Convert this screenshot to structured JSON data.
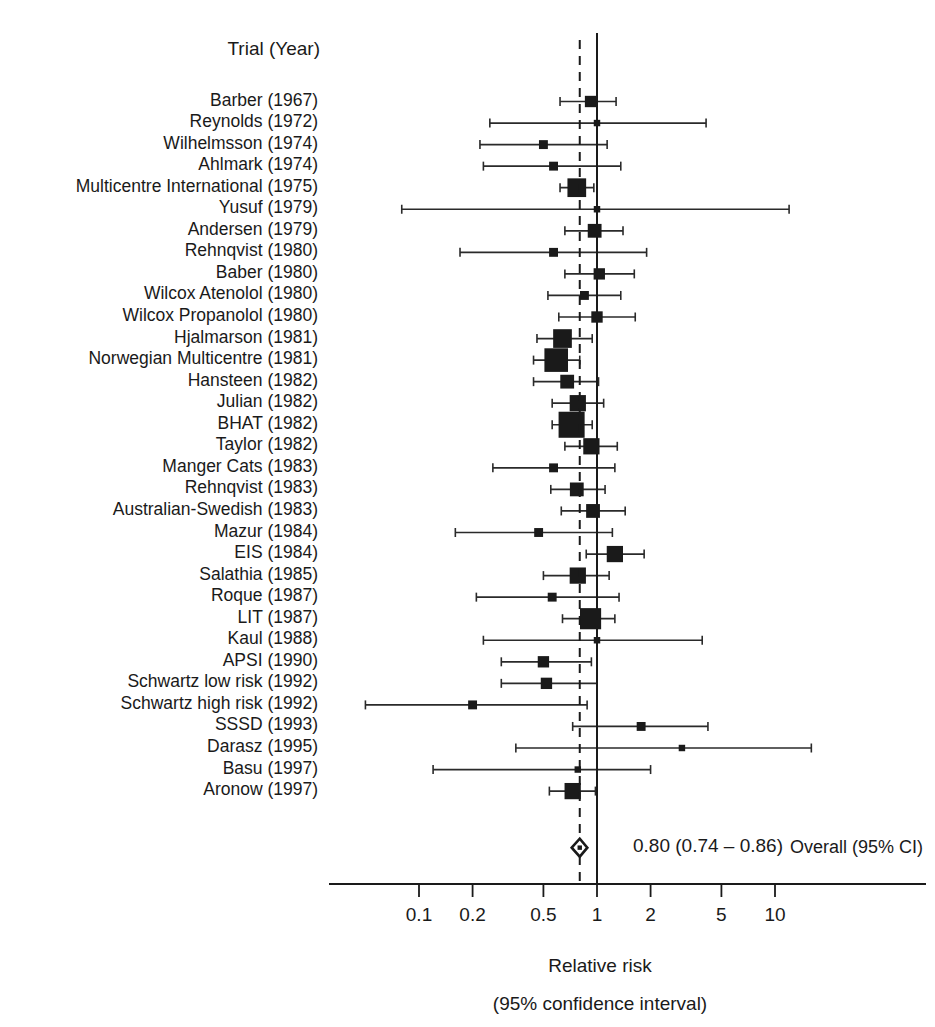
{
  "header": {
    "column_title": "Trial (Year)"
  },
  "axis": {
    "title_line1": "Relative risk",
    "title_line2": "(95% confidence interval)",
    "scale": "log",
    "tick_labels": [
      "0.1",
      "0.2",
      "0.5",
      "1",
      "2",
      "5",
      "10"
    ],
    "tick_values": [
      0.1,
      0.2,
      0.5,
      1,
      2,
      5,
      10
    ],
    "xmin": 0.07,
    "xmax": 16
  },
  "overall": {
    "label": "Overall (95% CI)",
    "value_text": "0.80 (0.74 – 0.86)",
    "rr": 0.8,
    "lower": 0.74,
    "upper": 0.86
  },
  "reference_line": 1,
  "pooled_line": 0.8,
  "chart_data": {
    "type": "forest",
    "title": "Trial (Year)",
    "xlabel": "Relative risk (95% confidence interval)",
    "xscale": "log",
    "xlim": [
      0.07,
      16
    ],
    "xticks": [
      0.1,
      0.2,
      0.5,
      1,
      2,
      5,
      10
    ],
    "effect_measure": "Relative risk",
    "null_value": 1,
    "pooled": {
      "label": "Overall (95% CI)",
      "rr": 0.8,
      "lower": 0.74,
      "upper": 0.86,
      "text": "0.80 (0.74 – 0.86)"
    },
    "studies": [
      {
        "label": "Barber (1967)",
        "rr": 0.92,
        "lower": 0.62,
        "upper": 1.28,
        "weight": 3
      },
      {
        "label": "Reynolds (1972)",
        "rr": 1.0,
        "lower": 0.25,
        "upper": 4.1,
        "weight": 1
      },
      {
        "label": "Wilhelmsson (1974)",
        "rr": 0.5,
        "lower": 0.22,
        "upper": 1.14,
        "weight": 2
      },
      {
        "label": "Ahlmark (1974)",
        "rr": 0.57,
        "lower": 0.23,
        "upper": 1.36,
        "weight": 2
      },
      {
        "label": "Multicentre International (1975)",
        "rr": 0.77,
        "lower": 0.62,
        "upper": 0.96,
        "weight": 6
      },
      {
        "label": "Yusuf (1979)",
        "rr": 1.0,
        "lower": 0.08,
        "upper": 12.0,
        "weight": 1
      },
      {
        "label": "Andersen (1979)",
        "rr": 0.97,
        "lower": 0.66,
        "upper": 1.4,
        "weight": 4
      },
      {
        "label": "Rehnqvist (1980)",
        "rr": 0.57,
        "lower": 0.17,
        "upper": 1.9,
        "weight": 2
      },
      {
        "label": "Baber (1980)",
        "rr": 1.03,
        "lower": 0.66,
        "upper": 1.62,
        "weight": 3
      },
      {
        "label": "Wilcox Atenolol (1980)",
        "rr": 0.85,
        "lower": 0.53,
        "upper": 1.36,
        "weight": 2
      },
      {
        "label": "Wilcox Propanolol (1980)",
        "rr": 1.0,
        "lower": 0.61,
        "upper": 1.64,
        "weight": 3
      },
      {
        "label": "Hjalmarson (1981)",
        "rr": 0.64,
        "lower": 0.46,
        "upper": 0.94,
        "weight": 6
      },
      {
        "label": "Norwegian Multicentre (1981)",
        "rr": 0.59,
        "lower": 0.44,
        "upper": 0.8,
        "weight": 8
      },
      {
        "label": "Hansteen (1982)",
        "rr": 0.68,
        "lower": 0.44,
        "upper": 1.02,
        "weight": 4
      },
      {
        "label": "Julian (1982)",
        "rr": 0.78,
        "lower": 0.56,
        "upper": 1.09,
        "weight": 5
      },
      {
        "label": "BHAT (1982)",
        "rr": 0.72,
        "lower": 0.56,
        "upper": 0.94,
        "weight": 9
      },
      {
        "label": "Taylor (1982)",
        "rr": 0.93,
        "lower": 0.66,
        "upper": 1.3,
        "weight": 5
      },
      {
        "label": "Manger Cats (1983)",
        "rr": 0.57,
        "lower": 0.26,
        "upper": 1.26,
        "weight": 2
      },
      {
        "label": "Rehnqvist (1983)",
        "rr": 0.77,
        "lower": 0.55,
        "upper": 1.11,
        "weight": 4
      },
      {
        "label": "Australian-Swedish (1983)",
        "rr": 0.95,
        "lower": 0.63,
        "upper": 1.44,
        "weight": 4
      },
      {
        "label": "Mazur (1984)",
        "rr": 0.47,
        "lower": 0.16,
        "upper": 1.22,
        "weight": 2
      },
      {
        "label": "EIS (1984)",
        "rr": 1.26,
        "lower": 0.87,
        "upper": 1.84,
        "weight": 5
      },
      {
        "label": "Salathia (1985)",
        "rr": 0.78,
        "lower": 0.5,
        "upper": 1.17,
        "weight": 5
      },
      {
        "label": "Roque (1987)",
        "rr": 0.56,
        "lower": 0.21,
        "upper": 1.33,
        "weight": 2
      },
      {
        "label": "LIT (1987)",
        "rr": 0.92,
        "lower": 0.64,
        "upper": 1.26,
        "weight": 7
      },
      {
        "label": "Kaul (1988)",
        "rr": 1.0,
        "lower": 0.23,
        "upper": 3.9,
        "weight": 1
      },
      {
        "label": "APSI (1990)",
        "rr": 0.5,
        "lower": 0.29,
        "upper": 0.93,
        "weight": 3
      },
      {
        "label": "Schwartz low risk (1992)",
        "rr": 0.52,
        "lower": 0.29,
        "upper": 1.0,
        "weight": 3
      },
      {
        "label": "Schwartz high risk (1992)",
        "rr": 0.2,
        "lower": 0.05,
        "upper": 0.88,
        "weight": 2
      },
      {
        "label": "SSSD (1993)",
        "rr": 1.77,
        "lower": 0.73,
        "upper": 4.2,
        "weight": 2
      },
      {
        "label": "Darasz (1995)",
        "rr": 3.0,
        "lower": 0.35,
        "upper": 16.0,
        "weight": 1
      },
      {
        "label": "Basu (1997)",
        "rr": 0.78,
        "lower": 0.12,
        "upper": 2.0,
        "weight": 1
      },
      {
        "label": "Aronow (1997)",
        "rr": 0.73,
        "lower": 0.54,
        "upper": 0.98,
        "weight": 5
      }
    ]
  },
  "style": {
    "marker_color": "#1a1a1a",
    "line_color": "#2a2a2a",
    "axis_color": "#1a1a1a"
  }
}
